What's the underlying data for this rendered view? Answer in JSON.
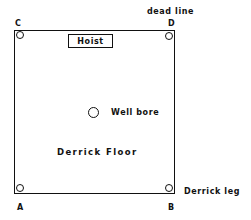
{
  "diagram": {
    "labels": {
      "dead_line": "dead line",
      "corner_c": "C",
      "corner_d": "D",
      "corner_a": "A",
      "corner_b": "B",
      "hoist": "Hoist",
      "well_bore": "Well bore",
      "derrick_floor": "Derrick Floor",
      "derrick_leg": "Derrick leg"
    },
    "colors": {
      "line": "#111111",
      "background": "#ffffff"
    }
  }
}
